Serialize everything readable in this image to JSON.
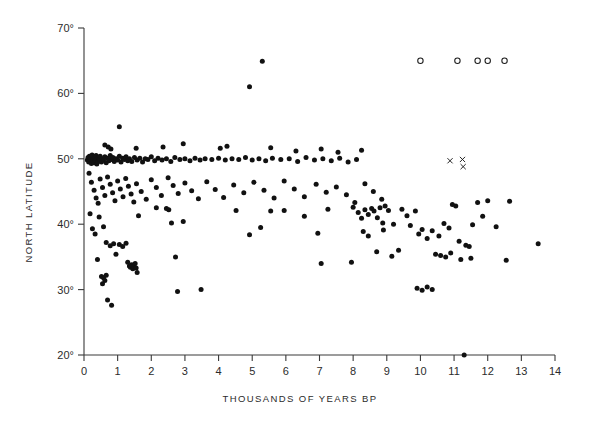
{
  "chart_data": {
    "type": "scatter",
    "title": "",
    "xlabel": "THOUSANDS OF YEARS BP",
    "ylabel": "NORTH LATITUDE",
    "xlim": [
      0,
      14
    ],
    "ylim": [
      20,
      70
    ],
    "xticks": [
      0,
      1,
      2,
      3,
      4,
      5,
      6,
      7,
      8,
      9,
      10,
      11,
      12,
      13,
      14
    ],
    "xticklabels": [
      "0",
      "1",
      "2",
      "3",
      "4",
      "5",
      "6",
      "7",
      "8",
      "9",
      "10",
      "11",
      "12",
      "13",
      "14"
    ],
    "yticks": [
      20,
      30,
      40,
      50,
      60,
      70
    ],
    "yticklabels": [
      "20°",
      "30°",
      "40°",
      "50°",
      "60°",
      "70°"
    ],
    "grid": false,
    "legend": "none",
    "series": [
      {
        "name": "filled-dots",
        "marker": "filled-circle",
        "color": "#111111",
        "points": [
          [
            0.1,
            49.8
          ],
          [
            0.12,
            50.2
          ],
          [
            0.14,
            49.5
          ],
          [
            0.16,
            50.4
          ],
          [
            0.18,
            49.9
          ],
          [
            0.2,
            50.1
          ],
          [
            0.22,
            49.3
          ],
          [
            0.24,
            50.6
          ],
          [
            0.26,
            49.7
          ],
          [
            0.28,
            50.0
          ],
          [
            0.3,
            49.4
          ],
          [
            0.32,
            50.3
          ],
          [
            0.34,
            49.8
          ],
          [
            0.36,
            50.5
          ],
          [
            0.38,
            49.2
          ],
          [
            0.4,
            50.1
          ],
          [
            0.42,
            49.6
          ],
          [
            0.44,
            50.2
          ],
          [
            0.46,
            49.9
          ],
          [
            0.48,
            50.4
          ],
          [
            0.52,
            49.5
          ],
          [
            0.55,
            50.0
          ],
          [
            0.58,
            49.8
          ],
          [
            0.62,
            50.3
          ],
          [
            0.66,
            49.4
          ],
          [
            0.7,
            50.1
          ],
          [
            0.74,
            49.7
          ],
          [
            0.78,
            50.5
          ],
          [
            0.82,
            49.9
          ],
          [
            0.86,
            50.2
          ],
          [
            0.9,
            49.6
          ],
          [
            0.95,
            50.0
          ],
          [
            1.0,
            49.8
          ],
          [
            1.05,
            50.4
          ],
          [
            1.1,
            49.5
          ],
          [
            1.15,
            50.1
          ],
          [
            1.2,
            49.9
          ],
          [
            1.25,
            50.3
          ],
          [
            1.3,
            49.7
          ],
          [
            1.35,
            50.0
          ],
          [
            1.42,
            49.6
          ],
          [
            1.5,
            50.2
          ],
          [
            1.58,
            49.8
          ],
          [
            1.66,
            50.1
          ],
          [
            1.74,
            49.5
          ],
          [
            1.82,
            50.0
          ],
          [
            1.9,
            49.9
          ],
          [
            2.0,
            50.3
          ],
          [
            2.1,
            49.7
          ],
          [
            2.2,
            50.1
          ],
          [
            2.32,
            49.8
          ],
          [
            2.45,
            50.0
          ],
          [
            2.58,
            49.6
          ],
          [
            2.7,
            50.2
          ],
          [
            2.85,
            49.9
          ],
          [
            3.0,
            50.0
          ],
          [
            3.15,
            49.7
          ],
          [
            3.3,
            50.1
          ],
          [
            3.45,
            49.8
          ],
          [
            3.6,
            50.0
          ],
          [
            3.8,
            49.9
          ],
          [
            4.0,
            50.1
          ],
          [
            4.2,
            49.8
          ],
          [
            4.4,
            50.0
          ],
          [
            4.6,
            49.9
          ],
          [
            4.8,
            50.2
          ],
          [
            5.0,
            49.8
          ],
          [
            5.2,
            50.0
          ],
          [
            5.4,
            49.7
          ],
          [
            5.6,
            50.1
          ],
          [
            5.85,
            49.9
          ],
          [
            6.1,
            50.0
          ],
          [
            6.35,
            49.6
          ],
          [
            6.6,
            50.2
          ],
          [
            6.85,
            49.8
          ],
          [
            7.1,
            50.0
          ],
          [
            7.35,
            49.7
          ],
          [
            7.6,
            50.1
          ],
          [
            7.85,
            49.5
          ],
          [
            8.1,
            49.9
          ],
          [
            0.62,
            52.1
          ],
          [
            0.72,
            51.8
          ],
          [
            0.8,
            51.5
          ],
          [
            1.05,
            54.9
          ],
          [
            1.55,
            51.6
          ],
          [
            2.35,
            51.8
          ],
          [
            2.95,
            52.3
          ],
          [
            4.05,
            51.6
          ],
          [
            4.25,
            51.9
          ],
          [
            5.55,
            51.7
          ],
          [
            6.3,
            51.2
          ],
          [
            7.05,
            51.5
          ],
          [
            7.55,
            51.0
          ],
          [
            8.25,
            51.3
          ],
          [
            4.92,
            61.0
          ],
          [
            5.3,
            64.9
          ],
          [
            0.15,
            47.8
          ],
          [
            0.22,
            46.4
          ],
          [
            0.3,
            45.2
          ],
          [
            0.36,
            44.0
          ],
          [
            0.42,
            43.2
          ],
          [
            0.48,
            46.9
          ],
          [
            0.55,
            45.6
          ],
          [
            0.62,
            44.4
          ],
          [
            0.7,
            47.2
          ],
          [
            0.78,
            46.1
          ],
          [
            0.85,
            44.8
          ],
          [
            0.92,
            43.6
          ],
          [
            1.0,
            46.6
          ],
          [
            1.08,
            45.4
          ],
          [
            1.16,
            44.2
          ],
          [
            1.24,
            47.0
          ],
          [
            1.32,
            45.8
          ],
          [
            1.4,
            44.6
          ],
          [
            1.48,
            43.4
          ],
          [
            1.56,
            46.2
          ],
          [
            1.7,
            45.0
          ],
          [
            1.85,
            43.8
          ],
          [
            2.0,
            46.8
          ],
          [
            2.15,
            45.6
          ],
          [
            2.3,
            44.4
          ],
          [
            2.5,
            47.1
          ],
          [
            2.65,
            45.9
          ],
          [
            2.8,
            44.7
          ],
          [
            3.0,
            46.3
          ],
          [
            3.2,
            45.1
          ],
          [
            3.4,
            43.9
          ],
          [
            3.65,
            46.5
          ],
          [
            3.9,
            45.3
          ],
          [
            4.15,
            44.1
          ],
          [
            4.45,
            46.0
          ],
          [
            4.75,
            44.8
          ],
          [
            5.05,
            46.4
          ],
          [
            5.35,
            45.2
          ],
          [
            5.65,
            44.0
          ],
          [
            5.95,
            46.6
          ],
          [
            6.25,
            45.4
          ],
          [
            6.55,
            44.2
          ],
          [
            6.9,
            46.1
          ],
          [
            7.2,
            44.9
          ],
          [
            7.5,
            45.7
          ],
          [
            7.8,
            44.5
          ],
          [
            8.05,
            43.3
          ],
          [
            8.35,
            46.2
          ],
          [
            8.6,
            45.0
          ],
          [
            8.85,
            43.8
          ],
          [
            0.18,
            41.6
          ],
          [
            0.25,
            39.3
          ],
          [
            0.33,
            38.5
          ],
          [
            0.45,
            41.1
          ],
          [
            0.58,
            39.6
          ],
          [
            0.66,
            37.2
          ],
          [
            0.78,
            36.7
          ],
          [
            0.88,
            37.0
          ],
          [
            0.95,
            35.4
          ],
          [
            1.05,
            36.9
          ],
          [
            1.15,
            36.6
          ],
          [
            1.25,
            37.1
          ],
          [
            1.35,
            33.6
          ],
          [
            1.38,
            33.4
          ],
          [
            1.42,
            33.8
          ],
          [
            1.45,
            33.2
          ],
          [
            1.48,
            33.6
          ],
          [
            1.52,
            34.0
          ],
          [
            1.55,
            33.3
          ],
          [
            1.58,
            32.6
          ],
          [
            1.3,
            34.2
          ],
          [
            0.52,
            32.0
          ],
          [
            0.58,
            31.8
          ],
          [
            0.62,
            31.4
          ],
          [
            0.66,
            32.2
          ],
          [
            0.55,
            30.9
          ],
          [
            0.7,
            28.4
          ],
          [
            0.82,
            27.6
          ],
          [
            0.4,
            34.6
          ],
          [
            1.62,
            41.3
          ],
          [
            2.6,
            40.2
          ],
          [
            2.72,
            35.0
          ],
          [
            2.78,
            29.7
          ],
          [
            3.48,
            30.0
          ],
          [
            2.15,
            42.5
          ],
          [
            2.45,
            42.4
          ],
          [
            2.52,
            42.2
          ],
          [
            2.95,
            40.4
          ],
          [
            4.52,
            42.1
          ],
          [
            4.92,
            38.4
          ],
          [
            5.25,
            39.5
          ],
          [
            5.55,
            42.0
          ],
          [
            5.95,
            42.1
          ],
          [
            6.55,
            41.2
          ],
          [
            6.95,
            38.6
          ],
          [
            7.25,
            42.3
          ],
          [
            7.05,
            34.0
          ],
          [
            8.0,
            42.6
          ],
          [
            8.15,
            41.8
          ],
          [
            8.25,
            40.9
          ],
          [
            8.35,
            42.2
          ],
          [
            8.45,
            41.5
          ],
          [
            8.55,
            42.4
          ],
          [
            8.62,
            42.0
          ],
          [
            8.72,
            41.0
          ],
          [
            8.8,
            42.5
          ],
          [
            8.88,
            40.2
          ],
          [
            8.95,
            42.8
          ],
          [
            8.3,
            38.9
          ],
          [
            8.45,
            38.2
          ],
          [
            8.9,
            39.1
          ],
          [
            9.05,
            42.1
          ],
          [
            9.2,
            40.0
          ],
          [
            9.45,
            42.3
          ],
          [
            9.6,
            41.3
          ],
          [
            9.7,
            39.8
          ],
          [
            9.85,
            42.0
          ],
          [
            9.95,
            38.5
          ],
          [
            10.05,
            39.2
          ],
          [
            10.2,
            37.8
          ],
          [
            10.35,
            39.0
          ],
          [
            10.55,
            38.2
          ],
          [
            10.7,
            40.1
          ],
          [
            10.85,
            39.4
          ],
          [
            10.95,
            43.0
          ],
          [
            11.05,
            42.8
          ],
          [
            11.15,
            37.4
          ],
          [
            11.35,
            36.8
          ],
          [
            11.45,
            36.6
          ],
          [
            11.55,
            39.9
          ],
          [
            11.7,
            43.3
          ],
          [
            11.85,
            41.2
          ],
          [
            12.0,
            43.6
          ],
          [
            12.25,
            39.6
          ],
          [
            12.55,
            34.5
          ],
          [
            12.65,
            43.5
          ],
          [
            13.5,
            37.0
          ],
          [
            9.9,
            30.2
          ],
          [
            10.05,
            29.9
          ],
          [
            10.2,
            30.4
          ],
          [
            10.35,
            30.0
          ],
          [
            11.3,
            20.0
          ],
          [
            9.15,
            35.1
          ],
          [
            9.35,
            36.0
          ],
          [
            7.95,
            34.2
          ],
          [
            8.7,
            35.8
          ],
          [
            10.45,
            35.4
          ],
          [
            10.6,
            35.2
          ],
          [
            10.75,
            35.0
          ],
          [
            10.9,
            35.6
          ],
          [
            11.2,
            34.6
          ],
          [
            11.5,
            34.8
          ]
        ]
      },
      {
        "name": "open-circles",
        "marker": "open-circle",
        "color": "#1a1a1a",
        "points": [
          [
            10.0,
            65.0
          ],
          [
            11.1,
            65.0
          ],
          [
            11.7,
            65.0
          ],
          [
            12.0,
            65.0
          ],
          [
            12.5,
            65.0
          ]
        ]
      },
      {
        "name": "cross-marks",
        "marker": "x",
        "color": "#1a1a1a",
        "points": [
          [
            10.88,
            49.7
          ],
          [
            11.25,
            49.9
          ],
          [
            11.27,
            48.8
          ]
        ]
      }
    ]
  }
}
